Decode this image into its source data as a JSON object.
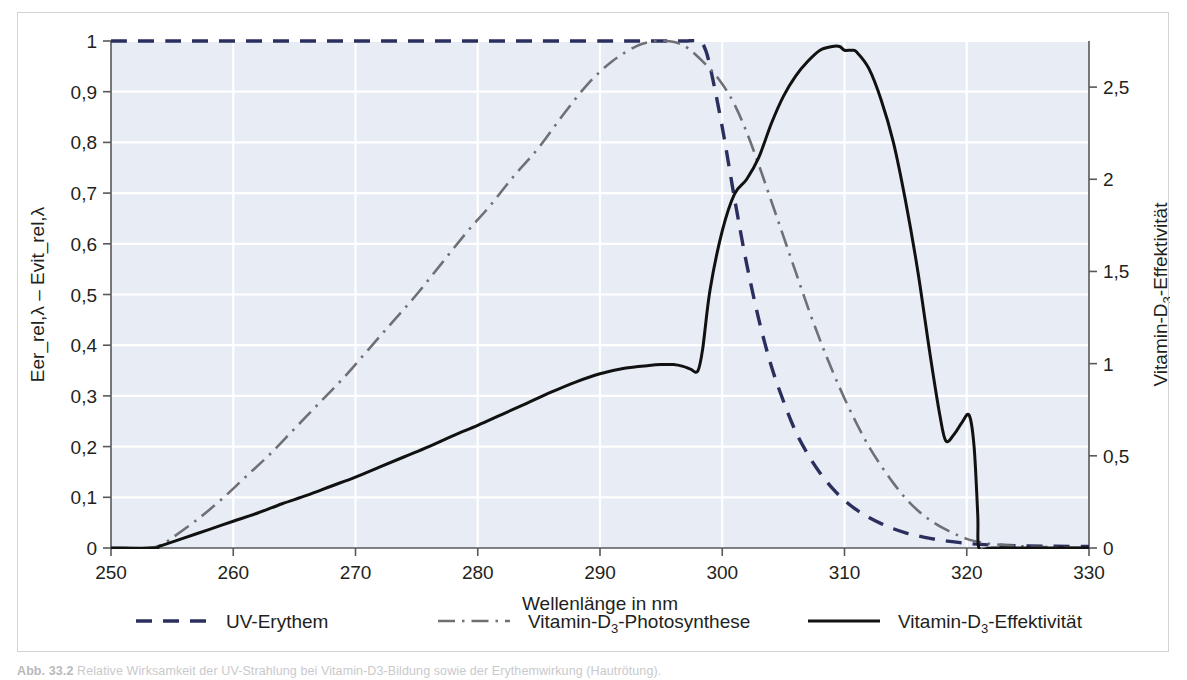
{
  "figure": {
    "caption_prefix": "Abb. 33.2",
    "caption_text": "Relative Wirksamkeit der UV-Strahlung bei Vitamin-D3-Bildung sowie der Erythemwirkung (Hautrötung)."
  },
  "chart_data": {
    "type": "line",
    "title": "",
    "xlabel": "Wellenlänge in nm",
    "ylabel_left": "Eer_rel,λ  –  Evit_rel,λ",
    "ylabel_right": "Vitamin-D3-Effektivität",
    "ylabel_right_parts": {
      "pre": "Vitamin-D",
      "sub": "3",
      "post": "-Effektivität"
    },
    "grid": true,
    "legend_position": "bottom",
    "xlim": [
      250,
      330
    ],
    "xticks": [
      250,
      260,
      270,
      280,
      290,
      300,
      310,
      320,
      330
    ],
    "xtick_labels": [
      "250",
      "260",
      "270",
      "280",
      "290",
      "300",
      "310",
      "320",
      "330"
    ],
    "ylim_left": [
      0,
      1
    ],
    "yticks_left": [
      0,
      0.1,
      0.2,
      0.3,
      0.4,
      0.5,
      0.6,
      0.7,
      0.8,
      0.9,
      1
    ],
    "ytick_labels_left": [
      "0",
      "0,1",
      "0,2",
      "0,3",
      "0,4",
      "0,5",
      "0,6",
      "0,7",
      "0,8",
      "0,9",
      "1"
    ],
    "ylim_right": [
      0,
      2.75
    ],
    "yticks_right": [
      0,
      0.5,
      1,
      1.5,
      2,
      2.5
    ],
    "ytick_labels_right": [
      "0",
      "0,5",
      "1",
      "1,5",
      "2",
      "2,5"
    ],
    "colors": {
      "uv_erythem": "#2b2f5e",
      "photosynthese": "#6f7076",
      "effektivitaet": "#111111",
      "plot_background": "#e8ecf4",
      "gridline": "#ffffff",
      "axis": "#58585b"
    },
    "series": [
      {
        "name": "UV-Erythem",
        "key": "uv_erythem",
        "axis": "left",
        "style": "dashed",
        "legend_label": "UV-Erythem",
        "x": [
          250,
          255,
          260,
          265,
          270,
          275,
          280,
          285,
          290,
          293,
          295,
          296,
          297,
          298,
          298.5,
          299,
          300,
          301,
          302,
          303,
          304,
          305,
          306,
          307,
          308,
          309,
          310,
          311,
          312,
          313,
          314,
          315,
          316,
          317,
          318,
          319,
          320,
          322,
          325,
          330
        ],
        "y": [
          1,
          1,
          1,
          1,
          1,
          1,
          1,
          1,
          1,
          1,
          1,
          1,
          1,
          1,
          0.99,
          0.95,
          0.83,
          0.69,
          0.56,
          0.45,
          0.36,
          0.29,
          0.23,
          0.185,
          0.148,
          0.118,
          0.094,
          0.075,
          0.06,
          0.048,
          0.038,
          0.03,
          0.024,
          0.019,
          0.015,
          0.012,
          0.009,
          0.006,
          0.004,
          0.003
        ]
      },
      {
        "name": "Vitamin-D3-Photosynthese",
        "key": "photosynthese",
        "axis": "left",
        "style": "dashdot",
        "legend_label_parts": {
          "pre": "Vitamin-D",
          "sub": "3",
          "post": "-Photosynthese"
        },
        "legend_label": "Vitamin-D3-Photosynthese",
        "x": [
          250,
          253,
          254,
          255,
          257,
          259,
          261,
          263,
          265,
          267,
          269,
          271,
          273,
          275,
          277,
          279,
          281,
          283,
          285,
          287,
          289,
          291,
          293,
          294.5,
          295.5,
          296.5,
          297.5,
          299,
          300,
          301,
          302,
          303,
          304,
          305,
          306,
          307,
          308,
          309,
          310,
          311,
          312,
          313,
          314,
          315,
          316,
          317,
          318,
          319,
          320,
          321,
          322,
          324,
          326,
          330
        ],
        "y": [
          0,
          0,
          0.005,
          0.02,
          0.055,
          0.095,
          0.14,
          0.185,
          0.235,
          0.285,
          0.335,
          0.39,
          0.445,
          0.5,
          0.56,
          0.62,
          0.675,
          0.735,
          0.79,
          0.855,
          0.915,
          0.96,
          0.99,
          1.0,
          1.0,
          0.995,
          0.98,
          0.945,
          0.915,
          0.875,
          0.82,
          0.755,
          0.685,
          0.615,
          0.545,
          0.475,
          0.41,
          0.35,
          0.295,
          0.245,
          0.2,
          0.162,
          0.128,
          0.098,
          0.074,
          0.055,
          0.04,
          0.028,
          0.018,
          0.012,
          0.008,
          0.004,
          0.002,
          0
        ]
      },
      {
        "name": "Vitamin-D3-Effektivität",
        "key": "effektivitaet",
        "axis": "right",
        "style": "solid",
        "legend_label_parts": {
          "pre": "Vitamin-D",
          "sub": "3",
          "post": "-Effektivität"
        },
        "legend_label": "Vitamin-D3-Effektivität",
        "x": [
          250,
          253.5,
          254,
          256,
          258,
          260,
          262,
          264,
          266,
          268,
          270,
          272,
          274,
          276,
          278,
          280,
          282,
          284,
          286,
          288,
          290,
          292,
          294,
          295,
          296,
          296.8,
          297.4,
          298,
          298.4,
          299,
          300,
          301,
          302,
          303,
          304,
          305,
          306,
          307,
          308,
          309,
          309.6,
          310,
          310.6,
          311,
          312,
          313,
          314,
          315,
          316,
          317,
          317.8,
          318.3,
          319,
          319.6,
          320.2,
          320.6,
          320.9,
          321,
          322,
          325,
          330
        ],
        "y_right": [
          0,
          0,
          0.01,
          0.055,
          0.1,
          0.145,
          0.19,
          0.24,
          0.285,
          0.335,
          0.385,
          0.44,
          0.495,
          0.55,
          0.61,
          0.665,
          0.725,
          0.785,
          0.845,
          0.9,
          0.945,
          0.975,
          0.99,
          0.995,
          0.995,
          0.985,
          0.97,
          0.96,
          1.08,
          1.4,
          1.72,
          1.92,
          2.0,
          2.12,
          2.3,
          2.45,
          2.56,
          2.64,
          2.7,
          2.72,
          2.72,
          2.7,
          2.7,
          2.69,
          2.6,
          2.43,
          2.2,
          1.88,
          1.5,
          1.05,
          0.72,
          0.58,
          0.62,
          0.68,
          0.72,
          0.55,
          0.18,
          0.0,
          0,
          0,
          0
        ]
      }
    ],
    "legend": [
      {
        "label": "UV-Erythem",
        "style": "dashed",
        "color": "#2b2f5e"
      },
      {
        "label": "Vitamin-D3-Photosynthese",
        "style": "dashdot",
        "color": "#6f7076"
      },
      {
        "label": "Vitamin-D3-Effektivität",
        "style": "solid",
        "color": "#111111"
      }
    ]
  }
}
